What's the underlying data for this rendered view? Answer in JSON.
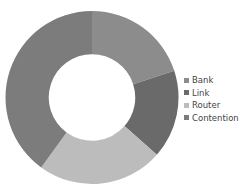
{
  "chart_data": {
    "type": "pie",
    "subtype": "donut",
    "title": "",
    "categories": [
      "Bank",
      "Link",
      "Router",
      "Contention"
    ],
    "values": [
      20,
      16.5,
      23.5,
      40
    ],
    "colors": [
      "#8c8c8c",
      "#6a6a6a",
      "#bcbcbc",
      "#7c7c7c"
    ],
    "start_angle_deg": 0,
    "direction": "clockwise",
    "hole_ratio": 0.5,
    "legend": {
      "position": "right",
      "entries": [
        {
          "label": "Bank",
          "color": "#8c8c8c"
        },
        {
          "label": "Link",
          "color": "#6a6a6a"
        },
        {
          "label": "Router",
          "color": "#bcbcbc"
        },
        {
          "label": "Contention",
          "color": "#7c7c7c"
        }
      ]
    },
    "data_labels": false
  }
}
